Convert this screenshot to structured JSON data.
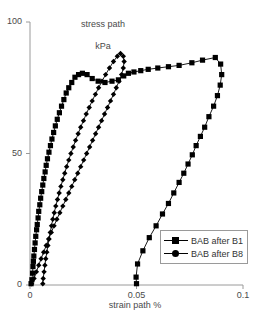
{
  "chart_data": {
    "type": "line",
    "title": "",
    "xlabel": "strain path %",
    "ylabel": "stress path\nkPa",
    "ylabel_line1": "stress path",
    "ylabel_line2": "kPa",
    "xlim": [
      0,
      0.1
    ],
    "ylim": [
      0,
      100
    ],
    "xticks": [
      0,
      0.05,
      0.1
    ],
    "xtick_labels": [
      "0",
      "0.05",
      "0.1"
    ],
    "yticks": [
      0,
      50,
      100
    ],
    "ytick_labels": [
      "0",
      "50",
      "100"
    ],
    "grid": false,
    "legend_position": "lower-right",
    "marker_colors": {
      "series1": "#000000",
      "series2": "#000000"
    },
    "line_color": "#000000",
    "axis_color": "#9a9a9a",
    "series": [
      {
        "name": "BAB after B1",
        "marker": "square",
        "points": [
          [
            0.0005,
            0.5
          ],
          [
            0.0009,
            2.0
          ],
          [
            0.0012,
            4.5
          ],
          [
            0.0014,
            7.0
          ],
          [
            0.0016,
            9.0
          ],
          [
            0.0018,
            11.0
          ],
          [
            0.0021,
            13.5
          ],
          [
            0.0024,
            16.0
          ],
          [
            0.0027,
            18.5
          ],
          [
            0.0031,
            21.0
          ],
          [
            0.0034,
            23.0
          ],
          [
            0.0038,
            25.5
          ],
          [
            0.0041,
            28.0
          ],
          [
            0.0046,
            30.5
          ],
          [
            0.005,
            33.0
          ],
          [
            0.0055,
            35.5
          ],
          [
            0.006,
            38.0
          ],
          [
            0.0065,
            40.5
          ],
          [
            0.0071,
            43.0
          ],
          [
            0.0076,
            45.5
          ],
          [
            0.0082,
            48.0
          ],
          [
            0.0089,
            50.5
          ],
          [
            0.0096,
            53.0
          ],
          [
            0.0103,
            55.5
          ],
          [
            0.0111,
            58.0
          ],
          [
            0.0119,
            60.5
          ],
          [
            0.0128,
            63.0
          ],
          [
            0.0138,
            65.5
          ],
          [
            0.0148,
            68.0
          ],
          [
            0.0159,
            70.5
          ],
          [
            0.017,
            73.0
          ],
          [
            0.0182,
            75.0
          ],
          [
            0.0196,
            77.0
          ],
          [
            0.0211,
            79.0
          ],
          [
            0.0228,
            80.0
          ],
          [
            0.0246,
            80.5
          ],
          [
            0.0268,
            80.0
          ],
          [
            0.0292,
            78.5
          ],
          [
            0.032,
            77.5
          ],
          [
            0.0352,
            77.0
          ],
          [
            0.0385,
            77.5
          ],
          [
            0.0415,
            78.0
          ],
          [
            0.044,
            79.5
          ],
          [
            0.0462,
            80.5
          ],
          [
            0.0488,
            81.0
          ],
          [
            0.052,
            81.5
          ],
          [
            0.0555,
            82.0
          ],
          [
            0.06,
            82.5
          ],
          [
            0.065,
            83.0
          ],
          [
            0.07,
            83.5
          ],
          [
            0.076,
            84.5
          ],
          [
            0.081,
            85.5
          ],
          [
            0.087,
            86.5
          ],
          [
            0.0895,
            84.0
          ],
          [
            0.09,
            80.0
          ],
          [
            0.0893,
            76.0
          ],
          [
            0.088,
            72.0
          ],
          [
            0.0862,
            68.0
          ],
          [
            0.084,
            64.0
          ],
          [
            0.082,
            60.0
          ],
          [
            0.08,
            56.5
          ],
          [
            0.078,
            53.0
          ],
          [
            0.0762,
            49.5
          ],
          [
            0.0742,
            46.0
          ],
          [
            0.0722,
            42.5
          ],
          [
            0.07,
            39.0
          ],
          [
            0.0675,
            35.0
          ],
          [
            0.065,
            31.0
          ],
          [
            0.0622,
            27.0
          ],
          [
            0.0592,
            22.5
          ],
          [
            0.056,
            18.0
          ],
          [
            0.053,
            13.0
          ],
          [
            0.0505,
            8.0
          ],
          [
            0.0498,
            3.0
          ],
          [
            0.05,
            0.5
          ]
        ]
      },
      {
        "name": "BAB after B8",
        "marker": "diamond",
        "points": [
          [
            0.006,
            0.5
          ],
          [
            0.0062,
            2.5
          ],
          [
            0.0066,
            5.0
          ],
          [
            0.007,
            7.5
          ],
          [
            0.0074,
            10.0
          ],
          [
            0.0079,
            12.5
          ],
          [
            0.0084,
            15.0
          ],
          [
            0.0089,
            17.5
          ],
          [
            0.0095,
            20.0
          ],
          [
            0.0101,
            22.5
          ],
          [
            0.0107,
            25.0
          ],
          [
            0.0114,
            27.5
          ],
          [
            0.0121,
            30.0
          ],
          [
            0.0129,
            32.5
          ],
          [
            0.0137,
            35.0
          ],
          [
            0.0145,
            37.5
          ],
          [
            0.0154,
            40.0
          ],
          [
            0.0163,
            42.5
          ],
          [
            0.0172,
            45.0
          ],
          [
            0.0182,
            47.5
          ],
          [
            0.0192,
            50.0
          ],
          [
            0.0203,
            52.5
          ],
          [
            0.0214,
            55.0
          ],
          [
            0.0226,
            57.5
          ],
          [
            0.0238,
            60.0
          ],
          [
            0.0251,
            62.5
          ],
          [
            0.0264,
            65.0
          ],
          [
            0.0278,
            67.5
          ],
          [
            0.0292,
            70.0
          ],
          [
            0.0307,
            72.5
          ],
          [
            0.0322,
            75.0
          ],
          [
            0.0338,
            77.5
          ],
          [
            0.0355,
            80.0
          ],
          [
            0.0373,
            82.5
          ],
          [
            0.0392,
            85.0
          ],
          [
            0.041,
            87.0
          ],
          [
            0.0425,
            88.0
          ],
          [
            0.0438,
            87.0
          ],
          [
            0.0442,
            85.0
          ],
          [
            0.0438,
            82.5
          ],
          [
            0.043,
            80.0
          ],
          [
            0.0418,
            77.5
          ],
          [
            0.0405,
            75.0
          ],
          [
            0.0392,
            72.5
          ],
          [
            0.0378,
            70.0
          ],
          [
            0.0364,
            67.5
          ],
          [
            0.035,
            65.0
          ],
          [
            0.0336,
            62.5
          ],
          [
            0.0322,
            60.0
          ],
          [
            0.0308,
            57.5
          ],
          [
            0.0294,
            55.0
          ],
          [
            0.028,
            52.5
          ],
          [
            0.0266,
            50.0
          ],
          [
            0.0252,
            47.5
          ],
          [
            0.0238,
            45.0
          ],
          [
            0.0224,
            42.5
          ],
          [
            0.021,
            40.0
          ],
          [
            0.0196,
            37.5
          ],
          [
            0.0182,
            35.0
          ],
          [
            0.0168,
            32.5
          ],
          [
            0.0154,
            30.0
          ],
          [
            0.014,
            27.5
          ],
          [
            0.0126,
            25.0
          ],
          [
            0.0113,
            22.5
          ],
          [
            0.01,
            20.0
          ],
          [
            0.0088,
            17.5
          ],
          [
            0.0076,
            15.0
          ],
          [
            0.0064,
            12.5
          ],
          [
            0.0052,
            10.0
          ],
          [
            0.0041,
            7.5
          ],
          [
            0.003,
            5.0
          ],
          [
            0.0019,
            2.5
          ],
          [
            0.0008,
            0.5
          ]
        ]
      }
    ]
  },
  "legend": {
    "entries": [
      {
        "label": "BAB after B1",
        "marker": "square"
      },
      {
        "label": "BAB after B8",
        "marker": "diamond"
      }
    ]
  }
}
